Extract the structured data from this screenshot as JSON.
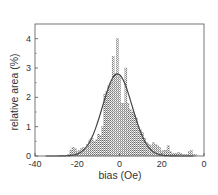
{
  "chart_data": {
    "type": "bar",
    "title": "",
    "xlabel": "bias (Oe)",
    "ylabel": "relative area (%)",
    "xlim": [
      -40,
      40
    ],
    "ylim": [
      0,
      4.5
    ],
    "x_ticks": [
      -40,
      -20,
      0,
      20,
      40
    ],
    "x_tick_labels": [
      "-40",
      "-20",
      "0",
      "20",
      "0"
    ],
    "y_ticks": [
      0,
      1,
      2,
      3,
      4
    ],
    "y_tick_labels": [
      "0",
      "1",
      "2",
      "3",
      "4"
    ],
    "grid": false,
    "legend": null,
    "bar_width": 1,
    "series": [
      {
        "name": "histogram",
        "type": "bar",
        "x": [
          -24,
          -23,
          -22,
          -21,
          -20,
          -19,
          -18,
          -17,
          -16,
          -15,
          -14,
          -13,
          -12,
          -11,
          -10,
          -9,
          -8,
          -7,
          -6,
          -5,
          -4,
          -3,
          -2,
          -1,
          0,
          1,
          2,
          3,
          4,
          5,
          6,
          7,
          8,
          9,
          10,
          11,
          12,
          13,
          14,
          15,
          16,
          17,
          18,
          19,
          20,
          21,
          22,
          23,
          24,
          25,
          26,
          27,
          28,
          29,
          30,
          31,
          32,
          33,
          34,
          35,
          36
        ],
        "values": [
          0.05,
          0.2,
          0.3,
          0.25,
          0.15,
          0.2,
          0.25,
          0.3,
          0.25,
          0.4,
          0.55,
          0.6,
          0.5,
          0.55,
          0.75,
          0.7,
          1.0,
          2.1,
          2.2,
          2.4,
          2.5,
          3.4,
          2.8,
          4.0,
          2.7,
          1.8,
          1.8,
          3.0,
          1.8,
          1.6,
          1.5,
          1.4,
          1.3,
          1.0,
          0.9,
          0.8,
          0.6,
          0.45,
          0.4,
          0.35,
          0.45,
          0.4,
          0.35,
          0.3,
          0.15,
          0.2,
          0.2,
          0.35,
          0.15,
          0.1,
          0.1,
          0.08,
          0.12,
          0.1,
          0.05,
          0.05,
          0.05,
          0.15,
          0.2,
          0.05,
          0.05
        ]
      },
      {
        "name": "gaussian fit",
        "type": "line",
        "center": -1,
        "peak": 2.8,
        "sigma": 7
      }
    ]
  }
}
